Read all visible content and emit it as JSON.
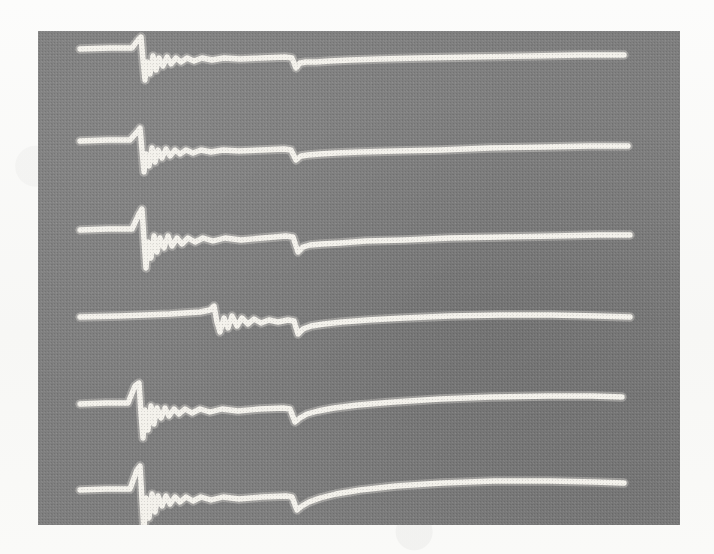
{
  "figure": {
    "kind": "oscillogram-photograph",
    "media_background_hex": "#7f7f7f",
    "trace_color_hex": "#f4f2ec",
    "page_background_hex": "#fbfbfa",
    "photo_region": {
      "x": 38,
      "y": 31,
      "width": 642,
      "height": 494
    },
    "trace_count": 6,
    "caption": "",
    "axis_labels_present": false,
    "tick_labels_present": false,
    "legend_present": false
  },
  "chart_data": {
    "type": "line",
    "title": "",
    "subtitle": "",
    "xlabel": "",
    "ylabel": "",
    "xlim": [
      0,
      642
    ],
    "ylim": [
      0,
      494
    ],
    "grid": false,
    "legend_position": "none",
    "annotations": [],
    "series": [
      {
        "name": "trace-1",
        "baseline_y": 48,
        "spike_x": 142,
        "spike_up_peak_y": 36,
        "spike_down_peak_y": 86,
        "ring_cycles": 7,
        "notch_x": 296,
        "notch_depth_y": 14,
        "tail_end_y": 56,
        "x_start": 80,
        "x_end": 624,
        "points_x": [
          80,
          110,
          132,
          138,
          141,
          143,
          145,
          147,
          150,
          153,
          156,
          159,
          163,
          167,
          171,
          176,
          181,
          187,
          194,
          202,
          212,
          224,
          240,
          262,
          285,
          292,
          296,
          300,
          306,
          316,
          330,
          350,
          380,
          420,
          470,
          530,
          580,
          624
        ],
        "points_y": [
          49,
          48,
          48,
          40,
          37,
          60,
          80,
          62,
          74,
          56,
          70,
          58,
          66,
          57,
          64,
          58,
          62,
          58,
          61,
          58,
          60,
          58,
          59,
          58,
          57,
          58,
          68,
          63,
          62,
          62,
          61,
          60,
          59,
          58,
          57,
          56,
          55,
          55
        ]
      },
      {
        "name": "trace-2",
        "baseline_y": 140,
        "spike_x": 142,
        "spike_up_peak_y": 126,
        "spike_down_peak_y": 176,
        "ring_cycles": 7,
        "notch_x": 296,
        "notch_depth_y": 13,
        "tail_end_y": 146,
        "x_start": 80,
        "x_end": 628,
        "points_x": [
          80,
          108,
          130,
          137,
          140,
          142,
          144,
          146,
          149,
          152,
          155,
          158,
          162,
          166,
          170,
          175,
          180,
          186,
          193,
          201,
          211,
          223,
          239,
          261,
          284,
          291,
          296,
          301,
          308,
          320,
          336,
          360,
          396,
          440,
          490,
          545,
          590,
          628
        ],
        "points_y": [
          141,
          140,
          140,
          132,
          128,
          150,
          172,
          154,
          166,
          148,
          162,
          150,
          158,
          149,
          156,
          150,
          154,
          150,
          153,
          150,
          152,
          150,
          151,
          150,
          149,
          150,
          160,
          156,
          155,
          154,
          153,
          152,
          151,
          150,
          148,
          147,
          146,
          146
        ]
      },
      {
        "name": "trace-3",
        "baseline_y": 228,
        "spike_x": 143,
        "spike_up_peak_y": 208,
        "spike_down_peak_y": 272,
        "ring_cycles": 7,
        "notch_x": 297,
        "notch_depth_y": 16,
        "tail_end_y": 236,
        "x_start": 80,
        "x_end": 630,
        "points_x": [
          80,
          108,
          132,
          139,
          142,
          144,
          146,
          148,
          151,
          154,
          157,
          160,
          164,
          168,
          172,
          177,
          182,
          188,
          195,
          203,
          213,
          225,
          241,
          263,
          286,
          293,
          298,
          303,
          310,
          322,
          340,
          366,
          404,
          450,
          500,
          555,
          598,
          630
        ],
        "points_y": [
          230,
          229,
          229,
          214,
          209,
          240,
          268,
          242,
          258,
          236,
          252,
          238,
          248,
          236,
          246,
          238,
          244,
          238,
          242,
          238,
          241,
          238,
          240,
          238,
          236,
          237,
          252,
          247,
          245,
          244,
          243,
          241,
          240,
          238,
          237,
          236,
          235,
          235
        ]
      },
      {
        "name": "trace-4",
        "baseline_y": 313,
        "spike_x": 216,
        "spike_up_peak_y": 305,
        "spike_down_peak_y": 336,
        "ring_cycles": 6,
        "notch_x": 297,
        "notch_depth_y": 14,
        "tail_end_y": 318,
        "x_start": 80,
        "x_end": 630,
        "points_x": [
          80,
          120,
          170,
          200,
          210,
          214,
          217,
          220,
          224,
          228,
          232,
          237,
          242,
          248,
          254,
          261,
          269,
          278,
          288,
          294,
          298,
          303,
          311,
          324,
          342,
          368,
          404,
          450,
          500,
          552,
          596,
          630
        ],
        "points_y": [
          317,
          316,
          314,
          312,
          310,
          306,
          322,
          332,
          318,
          328,
          316,
          326,
          318,
          324,
          319,
          323,
          320,
          322,
          320,
          321,
          334,
          329,
          326,
          324,
          322,
          320,
          318,
          316,
          315,
          315,
          316,
          317
        ]
      },
      {
        "name": "trace-5",
        "baseline_y": 400,
        "spike_x": 141,
        "spike_up_peak_y": 382,
        "spike_down_peak_y": 440,
        "ring_cycles": 8,
        "notch_x": 295,
        "notch_depth_y": 14,
        "tail_end_y": 396,
        "x_start": 80,
        "x_end": 622,
        "points_x": [
          80,
          106,
          128,
          135,
          139,
          141,
          143,
          145,
          148,
          151,
          154,
          157,
          161,
          165,
          169,
          174,
          179,
          185,
          192,
          200,
          210,
          222,
          238,
          260,
          283,
          290,
          295,
          300,
          307,
          318,
          334,
          358,
          394,
          440,
          492,
          548,
          592,
          622
        ],
        "points_y": [
          404,
          403,
          403,
          386,
          383,
          414,
          438,
          410,
          430,
          406,
          424,
          408,
          418,
          408,
          416,
          409,
          414,
          409,
          413,
          409,
          412,
          409,
          411,
          409,
          408,
          409,
          422,
          418,
          414,
          411,
          408,
          405,
          402,
          399,
          397,
          396,
          396,
          397
        ]
      },
      {
        "name": "trace-6",
        "baseline_y": 487,
        "spike_x": 142,
        "spike_up_peak_y": 468,
        "spike_down_peak_y": 532,
        "ring_cycles": 8,
        "notch_x": 297,
        "notch_depth_y": 15,
        "tail_end_y": 481,
        "x_start": 80,
        "x_end": 624,
        "points_x": [
          80,
          106,
          130,
          137,
          140,
          142,
          144,
          146,
          149,
          152,
          155,
          158,
          162,
          166,
          170,
          175,
          180,
          186,
          193,
          201,
          211,
          223,
          239,
          262,
          286,
          292,
          297,
          302,
          309,
          320,
          336,
          360,
          396,
          442,
          494,
          550,
          594,
          624
        ],
        "points_y": [
          490,
          489,
          489,
          470,
          466,
          500,
          530,
          498,
          518,
          494,
          512,
          496,
          506,
          496,
          504,
          497,
          502,
          497,
          501,
          497,
          500,
          497,
          499,
          497,
          496,
          497,
          510,
          506,
          502,
          498,
          494,
          490,
          486,
          483,
          481,
          481,
          482,
          483
        ]
      }
    ]
  }
}
